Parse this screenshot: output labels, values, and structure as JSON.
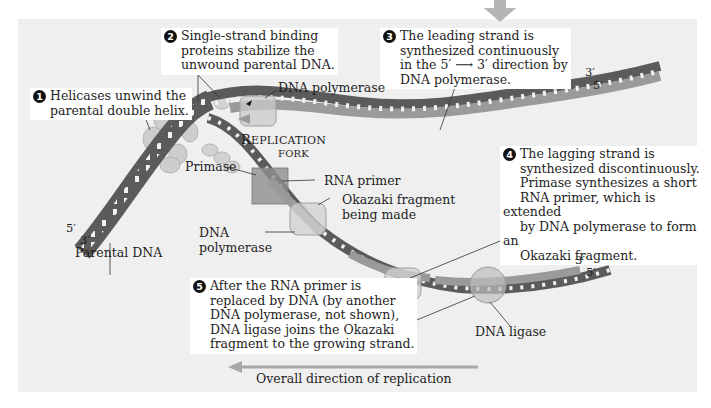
{
  "figure": {
    "overall_direction_label": "Overall direction of replication",
    "palette": {
      "background": "#ffffff",
      "panel": "#efefef",
      "parental_strand_dark": "#5b5b5b",
      "new_strand_light": "#9a9a9a",
      "protein_fill": "#c8c8c8",
      "arrow": "#a8a8a8"
    }
  },
  "steps": [
    {
      "number": "1",
      "text_lines": [
        "Helicases unwind the",
        "parental double helix."
      ]
    },
    {
      "number": "2",
      "text_lines": [
        "Single-strand binding",
        "proteins stabilize the",
        "unwound parental DNA."
      ]
    },
    {
      "number": "3",
      "text_lines": [
        "The leading strand is",
        "synthesized continuously",
        "in the 5′ ⟶ 3′ direction by",
        "DNA polymerase."
      ]
    },
    {
      "number": "4",
      "text_lines": [
        "The lagging strand is",
        "synthesized discontinuously.",
        "Primase synthesizes a short",
        "RNA primer, which is extended",
        "by DNA polymerase to form an",
        "Okazaki fragment."
      ]
    },
    {
      "number": "5",
      "text_lines": [
        "After the RNA primer is",
        "replaced by DNA (by another",
        "DNA polymerase, not shown),",
        "DNA ligase joins the Okazaki",
        "fragment to the growing strand."
      ]
    }
  ],
  "labels": {
    "dna_polymerase_top": "DNA polymerase",
    "replication_fork_line1_cap": "R",
    "replication_fork_line1_rest": "EPLICATION",
    "replication_fork_line2": "FORK",
    "primase": "Primase",
    "rna_primer": "RNA primer",
    "okazaki_line1": "Okazaki fragment",
    "okazaki_line2": "being made",
    "dna_polymerase_lower_line1": "DNA",
    "dna_polymerase_lower_line2": "polymerase",
    "parental_dna": "Parental DNA",
    "dna_ligase": "DNA ligase"
  },
  "strand_ends": {
    "left_top": "5′",
    "left_bottom": "3′",
    "leading_top": "3′",
    "leading_bottom": "5′",
    "lagging_top": "3′",
    "lagging_bottom": "5′"
  }
}
